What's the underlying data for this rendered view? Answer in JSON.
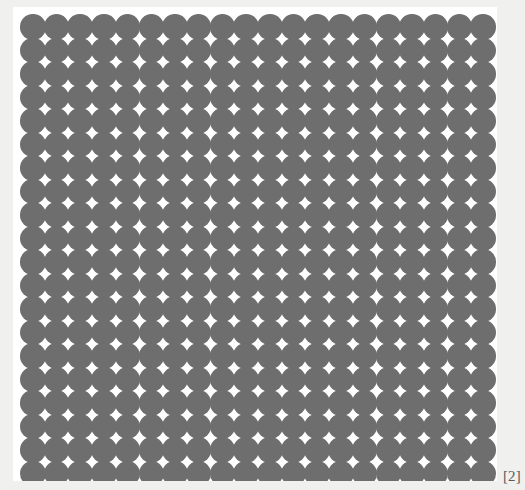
{
  "page": {
    "background_color": "#f0f0ef",
    "width": 525,
    "height": 490
  },
  "figure": {
    "panel_background": "#ffffff",
    "panel_left": 13,
    "panel_top": 7,
    "panel_width": 484,
    "panel_height": 474,
    "circle_color": "#6e6e6e",
    "grid": {
      "columns": 20,
      "rows": 20,
      "total_circles": 400,
      "pitch_x": 23.7,
      "pitch_y": 23.5,
      "circle_diameter": 25.5,
      "origin_x": 20,
      "origin_y": 14,
      "arrangement": "square-lattice-overlapping-disks"
    }
  },
  "citation": {
    "label": "[2]"
  },
  "chart_data": {
    "type": "scatter",
    "title": "",
    "subtitle": "",
    "xlabel": "",
    "ylabel": "",
    "grid": false,
    "legend": null,
    "annotations": [
      "[2]"
    ],
    "marker": {
      "shape": "circle",
      "color": "#6e6e6e",
      "diameter_px": 25.5,
      "filled": true,
      "edge": "none"
    },
    "xlim": [
      1,
      20
    ],
    "ylim": [
      1,
      20
    ],
    "x": [
      1,
      2,
      3,
      4,
      5,
      6,
      7,
      8,
      9,
      10,
      11,
      12,
      13,
      14,
      15,
      16,
      17,
      18,
      19,
      20
    ],
    "y": [
      1,
      2,
      3,
      4,
      5,
      6,
      7,
      8,
      9,
      10,
      11,
      12,
      13,
      14,
      15,
      16,
      17,
      18,
      19,
      20
    ],
    "series": [
      {
        "name": "lattice-points",
        "point_count": 400,
        "pattern": "cartesian-product of x and y index lists"
      }
    ]
  }
}
